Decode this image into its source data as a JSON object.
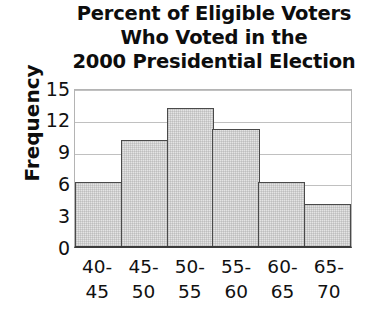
{
  "chart_data": {
    "type": "bar",
    "title": "Percent of Eligible Voters Who Voted in the 2000 Presidential Election",
    "title_lines": [
      "Percent of Eligible Voters",
      "Who Voted in the",
      "2000 Presidential Election"
    ],
    "xlabel": "",
    "ylabel": "Frequency",
    "categories": [
      "40-45",
      "45-50",
      "50-55",
      "55-60",
      "60-65",
      "65-70"
    ],
    "category_lines": [
      [
        "40-",
        "45"
      ],
      [
        "45-",
        "50"
      ],
      [
        "50-",
        "55"
      ],
      [
        "55-",
        "60"
      ],
      [
        "60-",
        "65"
      ],
      [
        "65-",
        "70"
      ]
    ],
    "values": [
      6,
      10,
      13,
      11,
      6,
      4
    ],
    "ylim": [
      0,
      15
    ],
    "yticks": [
      15,
      12,
      9,
      6,
      3,
      0
    ],
    "ytick_labels": [
      "15",
      "12",
      "9",
      "6",
      "3",
      "0"
    ],
    "grid": true,
    "grid_axis": "y",
    "legend": false,
    "bar_fill_color": "#e4e4e4",
    "bar_edge_color": "#4a4a4a",
    "gridline_color": "#c0c0c0",
    "axis_color": "#3b3b3b",
    "text_color": "#111111"
  }
}
